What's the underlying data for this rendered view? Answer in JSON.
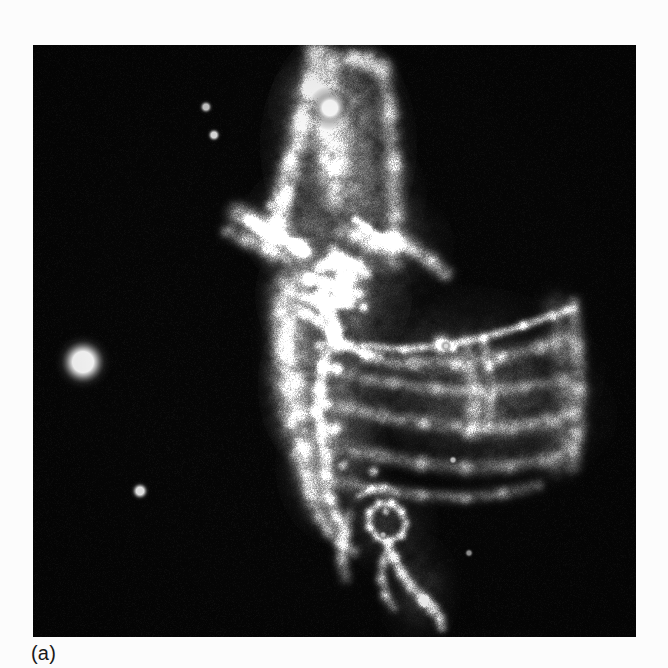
{
  "figure": {
    "caption": "(a)",
    "panel_label": "(a)",
    "background_color": "#fcfcfc",
    "panel_background_color": "#000000",
    "panel_x": 33,
    "panel_y": 45,
    "panel_width": 603,
    "panel_height": 592
  },
  "chart_data": {
    "type": "heatmap",
    "title": "(a)",
    "subtitle": "",
    "xlabel": "",
    "ylabel": "",
    "legend_position": "none",
    "grid": false,
    "colormap": "grayscale",
    "value_range": [
      0,
      255
    ],
    "axis_ranges": {
      "x": [
        0,
        603
      ],
      "y": [
        0,
        592
      ]
    },
    "stars": [
      {
        "name": "bright-field-star",
        "x": 50,
        "y": 317,
        "radius": 11,
        "brightness": 255
      },
      {
        "name": "nebula-embedded-star",
        "x": 297,
        "y": 63,
        "radius": 8,
        "brightness": 255
      },
      {
        "name": "faint-star-upper",
        "x": 173,
        "y": 62,
        "radius": 3,
        "brightness": 205
      },
      {
        "name": "faint-star-upper-2",
        "x": 181,
        "y": 90,
        "radius": 3,
        "brightness": 225
      },
      {
        "name": "faint-star-lower-left",
        "x": 107,
        "y": 446,
        "radius": 4,
        "brightness": 235
      },
      {
        "name": "faint-star-mid-right",
        "x": 413,
        "y": 301,
        "radius": 2,
        "brightness": 215
      },
      {
        "name": "faint-star-lower-right",
        "x": 420,
        "y": 415,
        "radius": 2,
        "brightness": 185
      },
      {
        "name": "faint-star-bottom",
        "x": 350,
        "y": 490,
        "radius": 2,
        "brightness": 180
      },
      {
        "name": "faint-star-bottom-2",
        "x": 436,
        "y": 508,
        "radius": 2,
        "brightness": 150
      }
    ],
    "nebula_regions": [
      {
        "name": "north-ridge",
        "cx": 310,
        "cy": 110,
        "intensity": 0.55
      },
      {
        "name": "north-west-filament",
        "cx": 248,
        "cy": 160,
        "intensity": 0.75
      },
      {
        "name": "central-knot-complex",
        "cx": 320,
        "cy": 240,
        "intensity": 0.95
      },
      {
        "name": "vertical-spine",
        "cx": 300,
        "cy": 330,
        "intensity": 0.85
      },
      {
        "name": "east-sheet",
        "cx": 450,
        "cy": 330,
        "intensity": 0.45
      },
      {
        "name": "south-loop",
        "cx": 360,
        "cy": 480,
        "intensity": 0.6
      },
      {
        "name": "south-tail",
        "cx": 390,
        "cy": 545,
        "intensity": 0.55
      }
    ],
    "detector_edges": [
      {
        "name": "right-field-edge",
        "x": 545
      },
      {
        "name": "upper-right-edge",
        "x": 365,
        "y_top": 10
      }
    ]
  }
}
